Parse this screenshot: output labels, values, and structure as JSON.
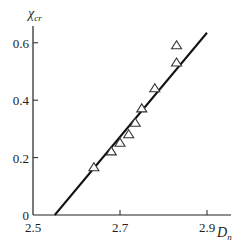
{
  "chart_data": {
    "type": "scatter",
    "title": "",
    "xlabel": "D_n",
    "ylabel": "χ_cr",
    "xlabel_main": "D",
    "xlabel_sub": "n",
    "ylabel_main": "χ",
    "ylabel_sub": "cr",
    "xlim": [
      2.5,
      2.95
    ],
    "ylim": [
      0,
      0.65
    ],
    "x_ticks": [
      2.5,
      2.7,
      2.9
    ],
    "x_tick_labels": [
      "2.5",
      "2.7",
      "2.9"
    ],
    "y_ticks": [
      0,
      0.2,
      0.4,
      0.6
    ],
    "y_tick_labels": [
      "0",
      "0.2",
      "0.4",
      "0.6"
    ],
    "grid": false,
    "legend": null,
    "series": [
      {
        "name": "experimental points",
        "marker": "open-triangle",
        "x": [
          2.64,
          2.68,
          2.7,
          2.72,
          2.735,
          2.75,
          2.78,
          2.83,
          2.83
        ],
        "y": [
          0.165,
          0.22,
          0.25,
          0.28,
          0.32,
          0.37,
          0.44,
          0.53,
          0.59
        ]
      },
      {
        "name": "linear fit",
        "type": "line",
        "x": [
          2.55,
          2.9
        ],
        "y": [
          0.0,
          0.635
        ]
      }
    ]
  }
}
